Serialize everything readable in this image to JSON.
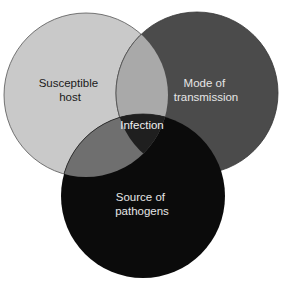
{
  "diagram": {
    "type": "venn",
    "circles": [
      {
        "id": "susceptible-host",
        "label_lines": [
          "Susceptible",
          "host"
        ],
        "fill": "#c9c9c9",
        "text_color": "#1a1a1a"
      },
      {
        "id": "mode-of-transmission",
        "label_lines": [
          "Mode of",
          "transmission"
        ],
        "fill": "#4b4b4b",
        "text_color": "#e6e6e6"
      },
      {
        "id": "source-of-pathogens",
        "label_lines": [
          "Source of",
          "pathogens"
        ],
        "fill": "#0b0b0b",
        "text_color": "#e6e6e6"
      }
    ],
    "overlaps": {
      "host_transmission": "#a9a9a9",
      "host_source": "#6f6f6f",
      "center": {
        "label": "Infection",
        "fill": "#1f1f1f",
        "text_color": "#f0f0f0"
      }
    }
  }
}
